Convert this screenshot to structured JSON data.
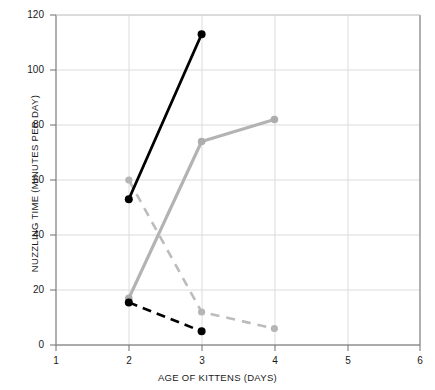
{
  "chart_data": {
    "type": "line",
    "title": "",
    "xlabel": "AGE OF KITTENS (DAYS)",
    "ylabel": "NUZZLING TIME (MINUTES PER DAY)",
    "xlim": [
      1,
      6
    ],
    "ylim": [
      0,
      120
    ],
    "xticks": [
      1,
      2,
      3,
      4,
      5,
      6
    ],
    "yticks": [
      0,
      20,
      40,
      60,
      80,
      100,
      120
    ],
    "grid": true,
    "legend": "none",
    "series": [
      {
        "name": "black-solid",
        "color": "#000000",
        "style": "solid",
        "marker": "circle",
        "x": [
          2,
          3
        ],
        "values": [
          53,
          113
        ]
      },
      {
        "name": "gray-solid",
        "color": "#b0b0b0",
        "style": "solid",
        "marker": "circle",
        "x": [
          2,
          3,
          4
        ],
        "values": [
          17,
          74,
          82
        ]
      },
      {
        "name": "gray-dashed",
        "color": "#b8b8b8",
        "style": "dashed",
        "marker": "circle",
        "x": [
          2,
          3,
          4
        ],
        "values": [
          60,
          12,
          6
        ]
      },
      {
        "name": "black-dashed",
        "color": "#000000",
        "style": "dashed",
        "marker": "circle",
        "x": [
          2,
          3
        ],
        "values": [
          15.5,
          5
        ]
      }
    ]
  },
  "axis": {
    "x_title": "AGE OF KITTENS (DAYS)",
    "y_title": "NUZZLING TIME (MINUTES PER DAY)",
    "x_tick_labels": [
      "1",
      "2",
      "3",
      "4",
      "5",
      "6"
    ],
    "y_tick_labels": [
      "0",
      "20",
      "40",
      "60",
      "80",
      "100",
      "120"
    ]
  },
  "colors": {
    "frame": "#8f8f8f",
    "grid": "#dcdcdc",
    "black_series": "#000000",
    "gray_series": "#b3b3b3",
    "background": "#ffffff"
  }
}
